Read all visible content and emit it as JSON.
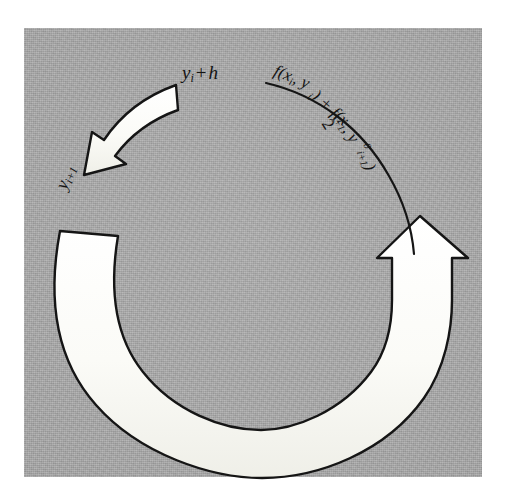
{
  "figure": {
    "name": "heun-method-predictor-corrector-cycle",
    "panel": {
      "background_color": "#a9a9a9",
      "border_color": "#ffffff"
    },
    "ink_color": "#141414",
    "band_fill_color": "#fdfdfb"
  },
  "labels": {
    "step_increment": {
      "full_text": "y_i + h",
      "base": "y",
      "sub": "i",
      "operator": "+",
      "step": "h"
    },
    "next_value": {
      "full_text": "y_i+1",
      "base": "y",
      "sub": "i+1"
    }
  },
  "fraction": {
    "full_text": "f(x_i, y_i) + f(x_i+1, y^0_i+1) / 2",
    "numerator_pieces": [
      {
        "text": "f(x",
        "sub": "i",
        "tail": ", y"
      },
      {
        "text": "y",
        "sub": "i",
        "tail": ") + f(x"
      },
      {
        "text": "x",
        "sub": "i+1",
        "tail": ", y"
      },
      {
        "text": "y",
        "sup": "0",
        "sub": "i+1",
        "tail": ")"
      }
    ],
    "denominator": "2"
  },
  "arrows": {
    "top_left": {
      "name": "corrector-arrow",
      "direction": "counter-clockwise-down-left",
      "head": "arrowhead-down-left"
    },
    "right": {
      "name": "predictor-arrow",
      "direction": "clockwise-up",
      "head": "arrowhead-up"
    }
  }
}
